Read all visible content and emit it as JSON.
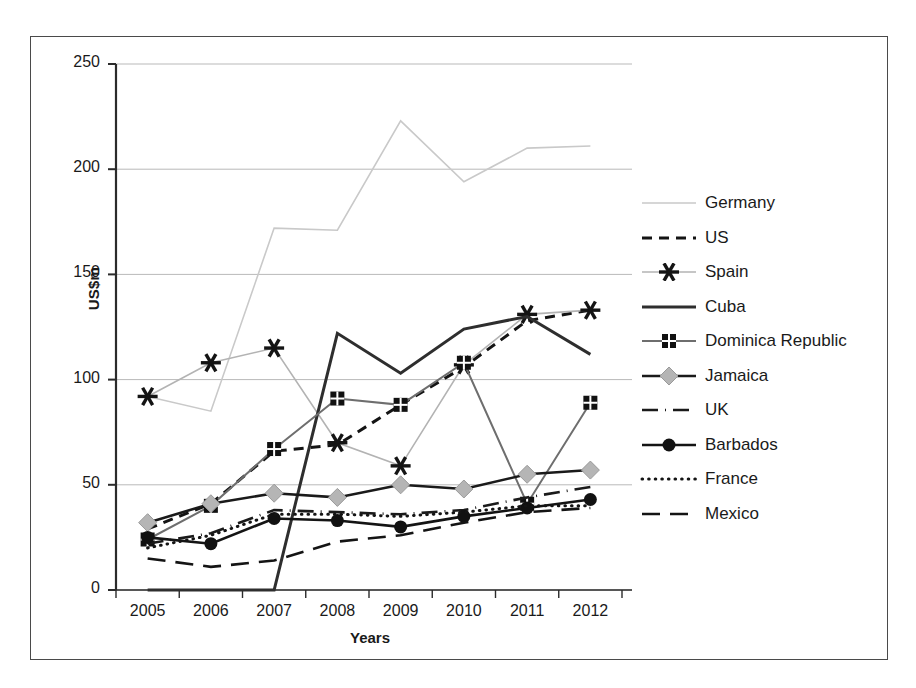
{
  "figure": {
    "y_axis_title": "US$m",
    "x_axis_title": "Years"
  },
  "axes": {
    "y_ticks": [
      "0",
      "50",
      "100",
      "150",
      "200",
      "250"
    ],
    "x_ticks": [
      "2005",
      "2006",
      "2007",
      "2008",
      "2009",
      "2010",
      "2011",
      "2012"
    ]
  },
  "legend": {
    "items": [
      {
        "label": "Germany",
        "icon": "line-swatch-germany",
        "color": "#c9c9c9",
        "style": "solid",
        "marker": "none",
        "width": 1.6
      },
      {
        "label": "US",
        "icon": "line-swatch-us",
        "color": "#141414",
        "style": "dashed",
        "marker": "none",
        "width": 3.0
      },
      {
        "label": "Spain",
        "icon": "line-swatch-spain",
        "color": "#b3b3b3",
        "style": "solid",
        "marker": "star",
        "width": 1.6
      },
      {
        "label": "Cuba",
        "icon": "line-swatch-cuba",
        "color": "#2e2e2e",
        "style": "solid",
        "marker": "none",
        "width": 3.0
      },
      {
        "label": "Dominica Republic",
        "icon": "line-swatch-dominica",
        "color": "#6e6e6e",
        "style": "solid",
        "marker": "square",
        "width": 2.0
      },
      {
        "label": "Jamaica",
        "icon": "line-swatch-jamaica",
        "color": "#1a1a1a",
        "style": "solid",
        "marker": "diamond",
        "width": 2.6
      },
      {
        "label": "UK",
        "icon": "line-swatch-uk",
        "color": "#1a1a1a",
        "style": "dashdot",
        "marker": "none",
        "width": 2.6
      },
      {
        "label": "Barbados",
        "icon": "line-swatch-barbados",
        "color": "#141414",
        "style": "solid",
        "marker": "circle",
        "width": 2.6
      },
      {
        "label": "France",
        "icon": "line-swatch-france",
        "color": "#141414",
        "style": "dotted",
        "marker": "none",
        "width": 3.0
      },
      {
        "label": "Mexico",
        "icon": "line-swatch-mexico",
        "color": "#141414",
        "style": "longdash",
        "marker": "none",
        "width": 2.6
      }
    ]
  },
  "chart_data": {
    "type": "line",
    "title": "",
    "subtitle": "",
    "xlabel": "Years",
    "ylabel": "US$m",
    "categories": [
      "2005",
      "2006",
      "2007",
      "2008",
      "2009",
      "2010",
      "2011",
      "2012"
    ],
    "ylim": [
      0,
      250
    ],
    "ytick_interval": 50,
    "grid": "horizontal",
    "legend_position": "right",
    "series": [
      {
        "name": "Germany",
        "values": [
          92,
          85,
          172,
          171,
          223,
          194,
          210,
          211
        ]
      },
      {
        "name": "US",
        "values": [
          29,
          41,
          66,
          69,
          88,
          106,
          128,
          133
        ]
      },
      {
        "name": "Spain",
        "values": [
          92,
          108,
          115,
          70,
          59,
          107,
          131,
          133
        ]
      },
      {
        "name": "Cuba",
        "values": [
          0,
          0,
          0,
          122,
          103,
          124,
          130,
          112
        ]
      },
      {
        "name": "Dominica Republic",
        "values": [
          24,
          40,
          67,
          91,
          88,
          108,
          41,
          89
        ]
      },
      {
        "name": "Jamaica",
        "values": [
          32,
          41,
          46,
          44,
          50,
          48,
          55,
          57
        ]
      },
      {
        "name": "UK",
        "values": [
          22,
          27,
          38,
          37,
          36,
          38,
          44,
          49
        ]
      },
      {
        "name": "Barbados",
        "values": [
          25,
          22,
          34,
          33,
          30,
          35,
          39,
          43
        ]
      },
      {
        "name": "France",
        "values": [
          20,
          26,
          36,
          36,
          35,
          37,
          40,
          40
        ]
      },
      {
        "name": "Mexico",
        "values": [
          15,
          11,
          14,
          23,
          26,
          32,
          37,
          39
        ]
      }
    ]
  }
}
